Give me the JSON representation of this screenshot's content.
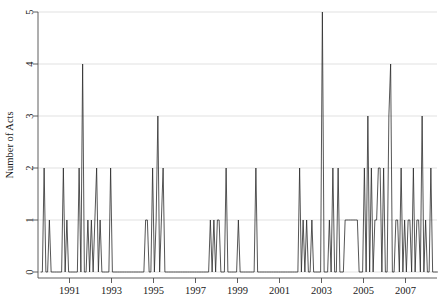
{
  "chart_data": {
    "type": "line",
    "title": "",
    "subtitle": "",
    "xlabel": "",
    "ylabel": "Number of Acts",
    "xlim": [
      1989.5,
      2008.5
    ],
    "ylim": [
      0,
      5
    ],
    "grid": "horizontal",
    "legend": "none",
    "x_tick_labels": [
      "1991",
      "1993",
      "1995",
      "1997",
      "1999",
      "2001",
      "2003",
      "2005",
      "2007"
    ],
    "x_tick_values": [
      1991,
      1993,
      1995,
      1997,
      1999,
      2001,
      2003,
      2005,
      2007
    ],
    "y_tick_labels": [
      "0",
      "1",
      "2",
      "3",
      "4",
      "5"
    ],
    "y_tick_values": [
      0,
      1,
      2,
      3,
      4,
      5
    ],
    "x_unit": "month",
    "x_start": 1989.625,
    "series": [
      {
        "name": "Number of Acts",
        "color": "#2b2b2b",
        "values": [
          0,
          0,
          2,
          0,
          0,
          1,
          0,
          0,
          0,
          0,
          0,
          0,
          0,
          2,
          0,
          1,
          0,
          0,
          0,
          0,
          0,
          0,
          2,
          0,
          4,
          0,
          0,
          1,
          0,
          1,
          0,
          1,
          2,
          0,
          1,
          0,
          0,
          0,
          0,
          0,
          2,
          0,
          0,
          0,
          0,
          0,
          0,
          0,
          0,
          0,
          0,
          0,
          0,
          0,
          0,
          0,
          0,
          0,
          0,
          0,
          1,
          1,
          0,
          0,
          2,
          0,
          1,
          3,
          0,
          1,
          2,
          0,
          0,
          0,
          0,
          0,
          0,
          0,
          0,
          0,
          0,
          0,
          0,
          0,
          0,
          0,
          0,
          0,
          0,
          0,
          0,
          0,
          0,
          0,
          0,
          0,
          0,
          1,
          0,
          1,
          0,
          1,
          1,
          0,
          0,
          0,
          2,
          0,
          0,
          0,
          0,
          0,
          0,
          1,
          0,
          0,
          0,
          0,
          0,
          0,
          0,
          0,
          0,
          2,
          0,
          0,
          0,
          0,
          0,
          0,
          0,
          0,
          0,
          0,
          0,
          0,
          0,
          0,
          0,
          0,
          0,
          0,
          0,
          0,
          0,
          0,
          0,
          0,
          2,
          0,
          1,
          0,
          1,
          0,
          0,
          1,
          0,
          0,
          0,
          0,
          0,
          5,
          0,
          0,
          0,
          1,
          0,
          2,
          0,
          0,
          2,
          0,
          0,
          0,
          1,
          1,
          1,
          1,
          1,
          1,
          1,
          1,
          0,
          0,
          0,
          2,
          0,
          3,
          0,
          2,
          0,
          1,
          1,
          2,
          2,
          0,
          2,
          0,
          0,
          3,
          4,
          0,
          0,
          1,
          1,
          0,
          2,
          0,
          1,
          0,
          1,
          1,
          0,
          2,
          0,
          1,
          1,
          0,
          3,
          0,
          1,
          0,
          0,
          2,
          0,
          0,
          0,
          0
        ]
      }
    ]
  },
  "axes": {
    "y_axis_title": "Number of Acts"
  }
}
